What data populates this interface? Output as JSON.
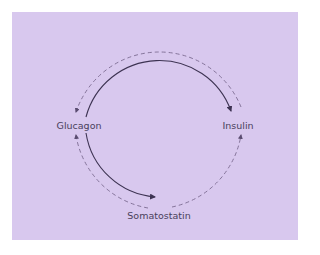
{
  "diagram": {
    "background_color": "#d8c8ee",
    "line_color": "#3d3352",
    "dashed_color": "#7a6a90",
    "nodes": [
      {
        "id": "glucagon",
        "label": "Glucagon"
      },
      {
        "id": "insulin",
        "label": "Insulin"
      },
      {
        "id": "somatostatin",
        "label": "Somatostatin"
      }
    ],
    "edges": [
      {
        "from": "glucagon",
        "to": "insulin",
        "style": "solid",
        "meaning": "stimulates"
      },
      {
        "from": "glucagon",
        "to": "somatostatin",
        "style": "solid",
        "meaning": "stimulates"
      },
      {
        "from": "insulin",
        "to": "glucagon",
        "style": "dashed",
        "meaning": "inhibits"
      },
      {
        "from": "somatostatin",
        "to": "glucagon",
        "style": "dashed",
        "meaning": "inhibits"
      },
      {
        "from": "somatostatin",
        "to": "insulin",
        "style": "dashed",
        "meaning": "inhibits"
      }
    ]
  }
}
